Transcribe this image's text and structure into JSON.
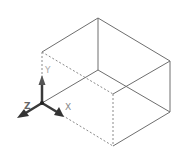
{
  "diagram": {
    "background": "#ffffff",
    "edge_color": "#6e6e6e",
    "hidden_edge_color": "#8a8a8a",
    "axis_color": "#3a3a3a",
    "axis_label_color": "#a8a8a8",
    "axes": {
      "x_label": "X",
      "y_label": "Y",
      "z_label": "Z"
    }
  }
}
